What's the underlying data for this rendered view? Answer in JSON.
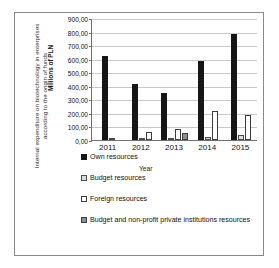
{
  "chart_data": {
    "type": "bar",
    "title": "",
    "xlabel": "Year",
    "ylabel": "Millions of PLN",
    "axis_title": "Internal expenditure on biotechnology in enterprises according to the origin of funds",
    "categories": [
      "2011",
      "2012",
      "2013",
      "2014",
      "2015"
    ],
    "ylim": [
      0,
      900
    ],
    "ytick_labels": [
      "900,00",
      "800,00",
      "700,00",
      "600,00",
      "500,00",
      "400,00",
      "300,00",
      "200,00",
      "100,00",
      "0,00"
    ],
    "ytick_values": [
      900,
      800,
      700,
      600,
      500,
      400,
      300,
      200,
      100,
      0
    ],
    "grid": true,
    "legend_position": "bottom-left",
    "series": [
      {
        "name": "Own resources",
        "color": "#161616",
        "values": [
          620,
          410,
          350,
          580,
          785
        ]
      },
      {
        "name": "Budget resources",
        "color": "#dcdcdc",
        "values": [
          8,
          5,
          6,
          22,
          38
        ]
      },
      {
        "name": "Foreign resources",
        "color": "#ffffff",
        "values": [
          0,
          62,
          78,
          215,
          185
        ]
      },
      {
        "name": "Budget and non-profit private institutions resources",
        "color": "#8e8e8e",
        "values": [
          0,
          0,
          55,
          0,
          0
        ]
      }
    ]
  },
  "legend": {
    "items": [
      {
        "label": "Own resources",
        "icon": "legend-swatch-black"
      },
      {
        "label": "Budget resources",
        "icon": "legend-swatch-light-gray"
      },
      {
        "label": "Foreign resources",
        "icon": "legend-swatch-white"
      },
      {
        "label": "Budget and non-profit private institutions resources",
        "icon": "legend-swatch-mid-gray"
      }
    ]
  }
}
